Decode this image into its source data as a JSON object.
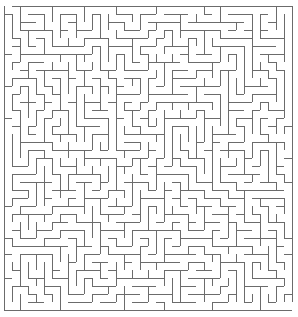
{
  "maze": {
    "cols": 36,
    "rows": 38,
    "cell_size": 8,
    "origin_x": 4,
    "origin_y": 6,
    "wall_color": "#6b6b6b",
    "background_color": "#ffffff",
    "wall_width": 1,
    "seed": 1337
  }
}
